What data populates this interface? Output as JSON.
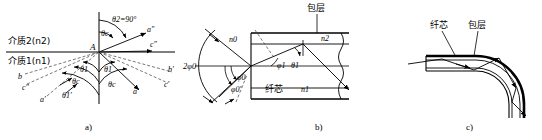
{
  "figure": {
    "title_absent": true,
    "panels": [
      {
        "id": "a",
        "caption": "a)",
        "media_upper": "介质2(n2)",
        "media_lower": "介质1(n1)",
        "vertex_label": "A",
        "angles": {
          "theta2": "θ2=90°",
          "theta_c_upper": "θc",
          "theta1_left": "θ1",
          "theta_c_left": "θc",
          "theta1_prime_left": "θ1′",
          "theta1_right": "θ1",
          "theta_c_right": "θc"
        },
        "rays": {
          "a_dprime": "a″",
          "c_dprime": "c″",
          "b_left": "b",
          "c_left": "c″",
          "a_left": "a′",
          "b_right": "b′",
          "c_right": "c′",
          "a_right": "a′"
        }
      },
      {
        "id": "b",
        "caption": "b)",
        "cladding_label": "包层",
        "core_label": "纤芯",
        "index_core": "n1",
        "index_clad": "n2",
        "index_outside": "n0",
        "angles": {
          "cone": "2φ0",
          "phi0": "φ0",
          "phi0_prime": "φ0′",
          "phi1": "φ1",
          "theta1": "θ1"
        }
      },
      {
        "id": "c",
        "caption": "c)",
        "core_label": "纤芯",
        "cladding_label": "包层"
      }
    ]
  },
  "colors": {
    "line": "#000000",
    "dashed": "#555555",
    "background": "#ffffff"
  }
}
